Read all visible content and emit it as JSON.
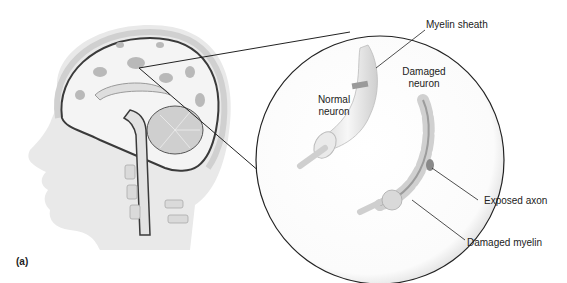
{
  "figure": {
    "panel_label": "(a)",
    "labels": {
      "myelin_sheath": "Myelin sheath",
      "normal_neuron_line1": "Normal",
      "normal_neuron_line2": "neuron",
      "damaged_neuron_line1": "Damaged",
      "damaged_neuron_line2": "neuron",
      "exposed_axon": "Exposed axon",
      "damaged_myelin": "Damaged myelin"
    },
    "colors": {
      "head_fill": "#e9e9e9",
      "brain_white": "#f4f4f4",
      "gray_matter": "#b9b9b9",
      "outline": "#3a3a3a",
      "leader_line": "#222222"
    }
  }
}
